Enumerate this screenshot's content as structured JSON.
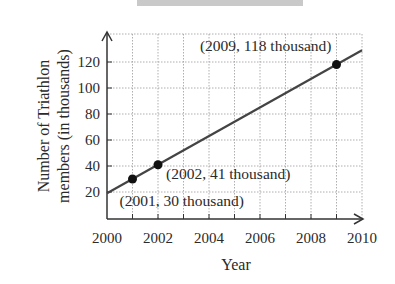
{
  "chart_data": {
    "type": "line",
    "title": "",
    "xlabel": "Year",
    "ylabel": "Number of Triathlon members (in thousands)",
    "ylabel_lines": [
      "Number of Triathlon",
      "members (in thousands)"
    ],
    "xlim": [
      2000,
      2010
    ],
    "ylim": [
      0,
      130
    ],
    "x_ticks": [
      2000,
      2002,
      2004,
      2006,
      2008,
      2010
    ],
    "x_tick_labels": [
      "2000",
      "2002",
      "2004",
      "2006",
      "2008",
      "2010"
    ],
    "y_ticks": [
      20,
      40,
      60,
      80,
      100,
      120
    ],
    "y_tick_labels": [
      "20",
      "40",
      "60",
      "80",
      "100",
      "120"
    ],
    "grid": true,
    "grid_style": "dotted",
    "legend": null,
    "series": [
      {
        "name": "Trend line",
        "x": [
          2000,
          2010
        ],
        "y": [
          19,
          129
        ]
      }
    ],
    "points": [
      {
        "x": 2001,
        "y": 30,
        "label": "(2001, 30 thousand)"
      },
      {
        "x": 2002,
        "y": 41,
        "label": "(2002, 41 thousand)"
      },
      {
        "x": 2009,
        "y": 118,
        "label": "(2009, 118 thousand)"
      }
    ]
  }
}
